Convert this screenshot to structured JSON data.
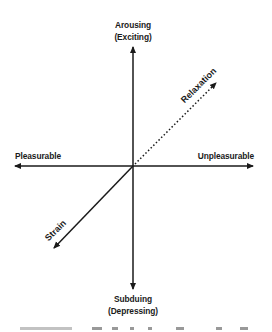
{
  "diagram": {
    "type": "two-dimensional affect space",
    "center": {
      "x": 133,
      "y": 166
    },
    "axes": {
      "vertical": {
        "top_label_line1": "Arousing",
        "top_label_line2": "(Exciting)",
        "bottom_label_line1": "Subduing",
        "bottom_label_line2": "(Depressing)"
      },
      "horizontal": {
        "left_label": "Pleasurable",
        "right_label": "Unpleasurable"
      }
    },
    "diagonals": {
      "upper_right": {
        "label": "Relaxation",
        "style": "dotted"
      },
      "lower_left": {
        "label": "Strain",
        "style": "solid"
      }
    },
    "colors": {
      "line": "#1a1a1a",
      "background": "#ffffff"
    }
  },
  "caption": {
    "visible": "clipped",
    "text": ""
  }
}
